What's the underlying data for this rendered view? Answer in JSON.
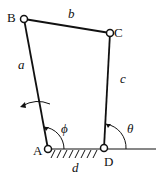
{
  "diagram": {
    "type": "four-bar linkage",
    "joints": {
      "A": {
        "label": "A",
        "x": 48,
        "y": 149
      },
      "B": {
        "label": "B",
        "x": 24,
        "y": 19
      },
      "C": {
        "label": "C",
        "x": 110,
        "y": 33
      },
      "D": {
        "label": "D",
        "x": 104,
        "y": 148
      }
    },
    "links": {
      "a": {
        "label": "a",
        "from": "A",
        "to": "B"
      },
      "b": {
        "label": "b",
        "from": "B",
        "to": "C"
      },
      "c": {
        "label": "c",
        "from": "D",
        "to": "C"
      },
      "d": {
        "label": "d",
        "from": "A",
        "to": "D"
      }
    },
    "angles": {
      "phi": {
        "label": "ϕ",
        "vertex": "A"
      },
      "theta": {
        "label": "θ",
        "vertex": "D"
      }
    },
    "colors": {
      "line": "#111111",
      "background": "#ffffff"
    }
  }
}
